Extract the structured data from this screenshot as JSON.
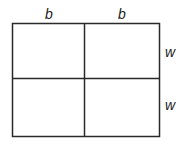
{
  "diagram": {
    "type": "2x2 rectangle grid",
    "top_labels": [
      "b",
      "b"
    ],
    "right_labels": [
      "w",
      "w"
    ],
    "line_color": "#2a2a2a"
  }
}
